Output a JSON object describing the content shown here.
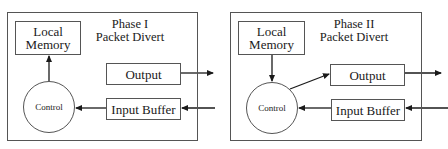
{
  "diagram": {
    "panels": [
      {
        "id": "phase-1",
        "title_line1": "Phase I",
        "title_line2": "Packet Divert",
        "memory_line1": "Local",
        "memory_line2": "Memory",
        "output_label": "Output",
        "input_label": "Input Buffer",
        "control_label": "Control",
        "edges": [
          "Control -> Local Memory",
          "Input Buffer -> Control",
          "Output -> external",
          "external -> Input Buffer"
        ]
      },
      {
        "id": "phase-2",
        "title_line1": "Phase II",
        "title_line2": "Packet Divert",
        "memory_line1": "Local",
        "memory_line2": "Memory",
        "output_label": "Output",
        "input_label": "Input Buffer",
        "control_label": "Control",
        "edges": [
          "Local Memory -> Control",
          "Control -> Output",
          "Input Buffer -> Control",
          "Output -> external",
          "external -> Input Buffer"
        ]
      }
    ],
    "colors": {
      "line": "#555555",
      "arrow": "#1a1a1a",
      "background": "#ffffff"
    }
  }
}
